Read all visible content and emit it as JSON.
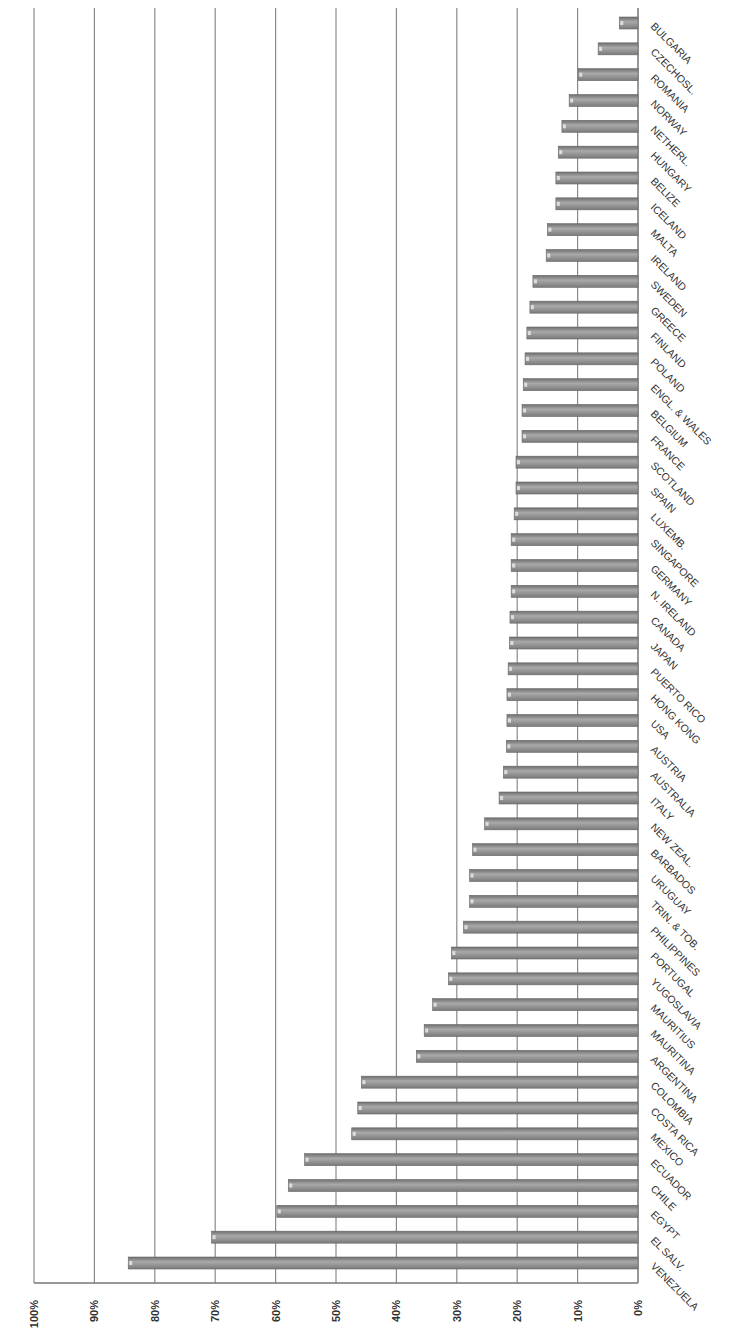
{
  "chart_data": {
    "type": "bar",
    "orientation": "vertical-bars rendered upside-down (image rotated 180°)",
    "title": "",
    "xlabel": "",
    "ylabel": "",
    "ylim": [
      0,
      100
    ],
    "y_ticks": [
      "0%",
      "10%",
      "20%",
      "30%",
      "40%",
      "50%",
      "60%",
      "70%",
      "80%",
      "90%",
      "100%"
    ],
    "grid": true,
    "legend": null,
    "bar_color": "#8c8c8c",
    "categories": [
      "VENEZUELA",
      "EL SALV.",
      "EGYPT",
      "CHILE",
      "ECUADOR",
      "MEXICO",
      "COSTA RICA",
      "COLOMBIA",
      "ARGENTINA",
      "MAURITINA",
      "MAURITIUS",
      "YUGOSLAVIA",
      "PORTUGAL",
      "PHILIPPINES",
      "TRIN. & TOB.",
      "URUGUAY",
      "BARBADOS",
      "NEW ZEAL.",
      "ITALY",
      "AUSTRALIA",
      "AUSTRIA",
      "USA",
      "HONG KONG",
      "PUERTO RICO",
      "JAPAN",
      "CANADA",
      "N. IRELAND",
      "GERMANY",
      "SINGAPORE",
      "LUXEMB.",
      "SPAIN",
      "SCOTLAND",
      "FRANCE",
      "BELGIUM",
      "ENGL. & WALES",
      "POLAND",
      "FINLAND",
      "GREECE",
      "SWEDEN",
      "IRELAND",
      "MALTA",
      "ICELAND",
      "BELIZE",
      "HUNGARY",
      "NETHERL.",
      "NORWAY",
      "ROMANIA",
      "CZECHOSL.",
      "BULGARIA"
    ],
    "values": [
      84.4,
      70.6,
      59.8,
      57.9,
      55.2,
      47.4,
      46.4,
      45.8,
      36.7,
      35.4,
      34.0,
      31.4,
      30.9,
      28.9,
      27.9,
      27.9,
      27.4,
      25.4,
      23.0,
      22.3,
      21.8,
      21.7,
      21.7,
      21.5,
      21.3,
      21.2,
      21.0,
      21.0,
      21.0,
      20.5,
      20.2,
      20.2,
      19.2,
      19.2,
      19.0,
      18.7,
      18.4,
      17.9,
      17.4,
      15.2,
      15.0,
      13.6,
      13.6,
      13.2,
      12.6,
      11.4,
      9.9,
      6.6,
      3.1
    ]
  }
}
